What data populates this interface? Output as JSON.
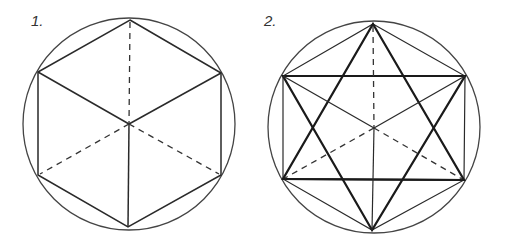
{
  "figures": [
    {
      "label": "1.",
      "description": "Hexagon inscribed in circle drawn as isometric cube with hidden edges dashed",
      "circle": {
        "cx": 129,
        "cy": 124,
        "r": 106
      },
      "vertices": {
        "top": [
          130,
          20
        ],
        "upper_left": [
          38,
          72
        ],
        "upper_right": [
          221,
          73
        ],
        "lower_left": [
          38,
          175
        ],
        "lower_right": [
          221,
          175
        ],
        "bottom": [
          128,
          227
        ],
        "center": [
          129,
          124
        ]
      }
    },
    {
      "label": "2.",
      "description": "Hexagon inscribed in circle with hexagram star, rectangle and cube edges",
      "circle": {
        "cx": 374,
        "cy": 127,
        "r": 106
      },
      "vertices": {
        "top": [
          373,
          24
        ],
        "upper_left": [
          283,
          76
        ],
        "upper_right": [
          465,
          76
        ],
        "lower_left": [
          283,
          179
        ],
        "lower_right": [
          464,
          180
        ],
        "bottom": [
          372,
          230
        ],
        "center": [
          374,
          128
        ]
      }
    }
  ],
  "colors": {
    "line": "#2a2a2a",
    "background": "#ffffff"
  }
}
